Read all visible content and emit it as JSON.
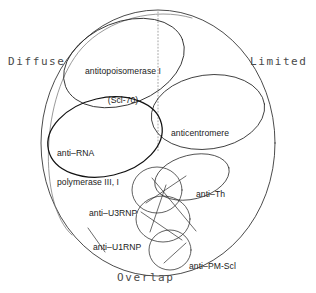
{
  "figure": {
    "background_color": "#ffffff",
    "stroke_color": "#2b2b2b",
    "text_color": "#1a1a1a"
  },
  "axis_labels": [
    {
      "id": "diffuse",
      "text": "Diffuse",
      "x": 8,
      "y": 56
    },
    {
      "id": "limited",
      "text": "Limited",
      "x": 250,
      "y": 56
    },
    {
      "id": "overlap",
      "text": "Overlap",
      "x": 117,
      "y": 272
    }
  ],
  "regions": [
    {
      "id": "antitopoisomerase",
      "lines": [
        "antitopoisomerase I",
        "(Scl-70)"
      ],
      "x": 85,
      "y": 48,
      "align": "center"
    },
    {
      "id": "anticentromere",
      "lines": [
        "anticentromere"
      ],
      "x": 171,
      "y": 110,
      "align": "left"
    },
    {
      "id": "anti-rna-polymerase",
      "lines": [
        "anti–RNA",
        "polymerase III, I"
      ],
      "x": 57,
      "y": 130,
      "align": "left"
    },
    {
      "id": "anti-th",
      "lines": [
        "anti–Th"
      ],
      "x": 196,
      "y": 171,
      "align": "left"
    },
    {
      "id": "anti-u3rnp",
      "lines": [
        "anti–U3RNP"
      ],
      "x": 89,
      "y": 190,
      "align": "left"
    },
    {
      "id": "anti-u1rnp",
      "lines": [
        "anti–U1RNP"
      ],
      "x": 93,
      "y": 224,
      "align": "left"
    },
    {
      "id": "anti-pm-scl",
      "lines": [
        "anti–PM-Scl"
      ],
      "x": 189,
      "y": 243,
      "align": "left"
    }
  ]
}
